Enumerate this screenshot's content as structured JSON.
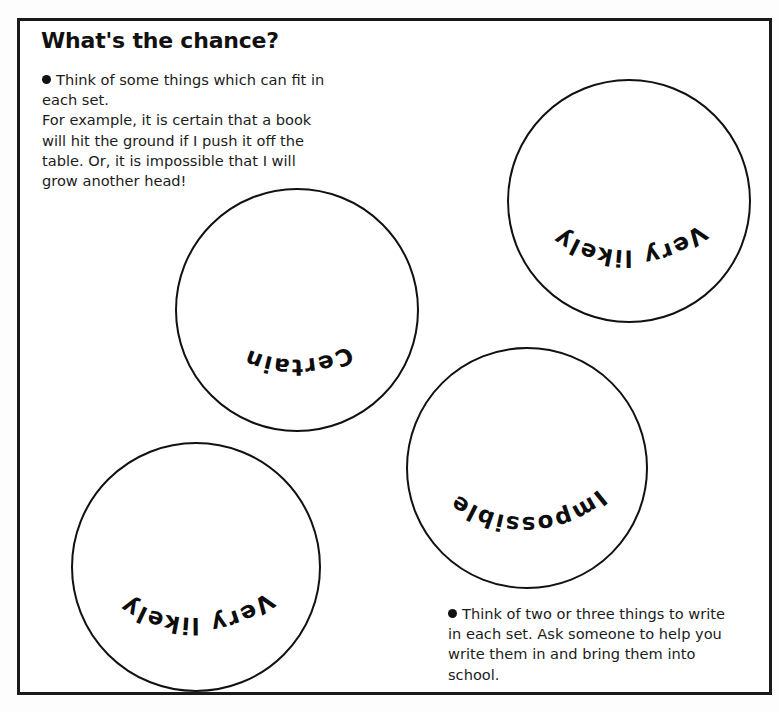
{
  "document": {
    "title": "What's the chance?",
    "frame_color": "#1a1a1a",
    "ink_color": "#111111",
    "paper_color": "#ffffff"
  },
  "instructions": {
    "top": {
      "bullet": "●",
      "lines": [
        "Think of some things which can fit in",
        "each set.",
        "For example, it is certain that a book",
        "will hit the ground if I push it off the",
        "table. Or, it is impossible that I will",
        "grow another head!"
      ]
    },
    "bottom": {
      "bullet": "●",
      "lines": [
        "Think of two or three things to write",
        "in each set. Ask someone to help you",
        "write them in and bring them into",
        "school."
      ]
    }
  },
  "sets": [
    {
      "id": "certain",
      "label": "Certain",
      "cx": 297,
      "cy": 310,
      "r": 121
    },
    {
      "id": "very-likely-top-right",
      "label": "Very likely",
      "cx": 629,
      "cy": 201,
      "r": 121
    },
    {
      "id": "impossible",
      "label": "Impossible",
      "cx": 527,
      "cy": 468,
      "r": 120
    },
    {
      "id": "very-likely-bottom-left",
      "label": "Very likely",
      "cx": 196,
      "cy": 567,
      "r": 124
    }
  ]
}
